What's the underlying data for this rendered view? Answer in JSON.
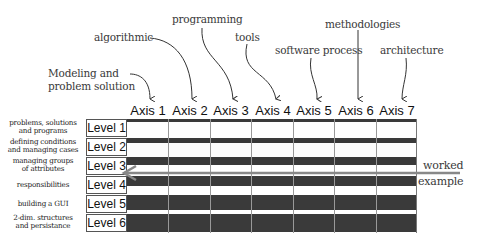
{
  "annotations": [
    {
      "id": "modeling",
      "lines": [
        "Modeling and",
        "problem solution"
      ],
      "target_axis": 1
    },
    {
      "id": "algorithmic",
      "lines": [
        "algorithmic"
      ],
      "target_axis": 2
    },
    {
      "id": "programming",
      "lines": [
        "programming"
      ],
      "target_axis": 3
    },
    {
      "id": "tools",
      "lines": [
        "tools"
      ],
      "target_axis": 4
    },
    {
      "id": "software-process",
      "lines": [
        "software process"
      ],
      "target_axis": 5
    },
    {
      "id": "methodologies",
      "lines": [
        "methodologies"
      ],
      "target_axis": 6
    },
    {
      "id": "architecture",
      "lines": [
        "architecture"
      ],
      "target_axis": 7
    }
  ],
  "axes": [
    "Axis 1",
    "Axis 2",
    "Axis 3",
    "Axis 4",
    "Axis 5",
    "Axis 6",
    "Axis 7"
  ],
  "levels": [
    {
      "label": "Level 1",
      "desc": [
        "problems, solutions",
        "and programs"
      ],
      "bar_fill": 0.16
    },
    {
      "label": "Level 2",
      "desc": [
        "defining conditions",
        "and managing cases"
      ],
      "bar_fill": 0.28
    },
    {
      "label": "Level 3",
      "desc": [
        "managing groups",
        "of attributes"
      ],
      "bar_fill": 0.45
    },
    {
      "label": "Level 4",
      "desc": [
        "responsibilities"
      ],
      "bar_fill": 0.55
    },
    {
      "label": "Level 5",
      "desc": [
        "building a GUI"
      ],
      "bar_fill": 0.78
    },
    {
      "label": "Level 6",
      "desc": [
        "2-dim. structures",
        "and persistance"
      ],
      "bar_fill": 0.95
    }
  ],
  "worked_example": {
    "line1": "worked",
    "line2": "example",
    "points_to_level": "Level 3"
  },
  "colors": {
    "bar": "#3a3a3a",
    "arrow": "#888888",
    "grid": "#999999"
  }
}
